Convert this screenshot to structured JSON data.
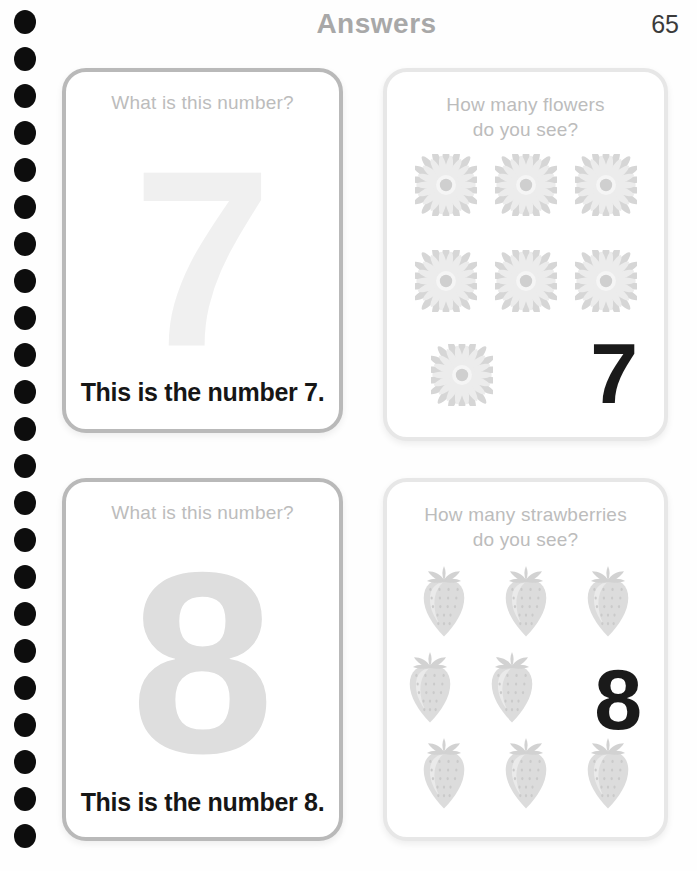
{
  "header": {
    "title": "Answers",
    "page_number": "65"
  },
  "binding": {
    "dot_count": 23,
    "dot_color": "#0d0d0d"
  },
  "colors": {
    "question_text": "#bcbcbc",
    "title_text": "#a8a8a8",
    "answer_text": "#161616",
    "trace_7": "#f0f0f0",
    "trace_8": "#dedede",
    "card_border_dark": "#b9b9b9",
    "card_border_light": "#e7e7e7",
    "item_gray": "#d9d9d9"
  },
  "cards": [
    {
      "id": "number-7-trace",
      "question": "What is this number?",
      "trace_digit": "7",
      "answer": "This is the number 7."
    },
    {
      "id": "count-flowers-7",
      "question_line1": "How many flowers",
      "question_line2": "do you see?",
      "item": "flower",
      "count_label": "7",
      "item_rows": [
        3,
        3,
        1
      ],
      "total_items": 7
    },
    {
      "id": "number-8-trace",
      "question": "What is this number?",
      "trace_digit": "8",
      "answer": "This is the number 8."
    },
    {
      "id": "count-strawberries-8",
      "question_line1": "How many strawberries",
      "question_line2": "do you see?",
      "item": "strawberry",
      "count_label": "8",
      "item_rows": [
        3,
        2,
        3
      ],
      "total_items": 8
    }
  ]
}
